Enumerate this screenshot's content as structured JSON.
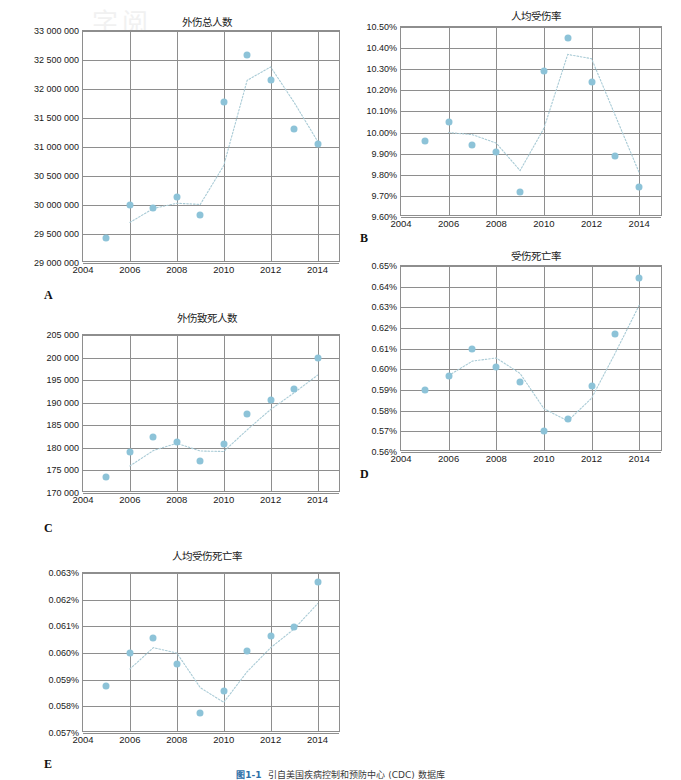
{
  "document": {
    "watermark": "字阅",
    "caption_figure_no": "图1-1",
    "caption_text": "引自美国疾病控制和预防中心 (CDC) 数据库"
  },
  "panels": [
    {
      "letter": "A",
      "title": "外伤总人数",
      "x": 62,
      "y": 14,
      "w": 290,
      "h": 260,
      "plot": {
        "left": 82,
        "top": 30,
        "width": 258,
        "height": 232
      },
      "letter_pos": {
        "left": 44,
        "top": 288
      }
    },
    {
      "letter": "B",
      "title": "人均受伤率",
      "x": 398,
      "y": 8,
      "w": 275,
      "h": 230,
      "plot": {
        "left": 400,
        "top": 26,
        "width": 262,
        "height": 190
      },
      "letter_pos": {
        "left": 360,
        "top": 231
      }
    },
    {
      "letter": "C",
      "title": "外伤致死人数",
      "x": 62,
      "y": 310,
      "w": 290,
      "h": 230,
      "plot": {
        "left": 82,
        "top": 334,
        "width": 258,
        "height": 158
      },
      "letter_pos": {
        "left": 44,
        "top": 521
      }
    },
    {
      "letter": "D",
      "title": "受伤死亡率",
      "x": 398,
      "y": 248,
      "w": 275,
      "h": 230,
      "plot": {
        "left": 400,
        "top": 265,
        "width": 262,
        "height": 186
      },
      "letter_pos": {
        "left": 360,
        "top": 467
      }
    },
    {
      "letter": "E",
      "title": "人均受伤死亡率",
      "x": 62,
      "y": 548,
      "w": 290,
      "h": 230,
      "plot": {
        "left": 82,
        "top": 572,
        "width": 258,
        "height": 160
      },
      "letter_pos": {
        "left": 44,
        "top": 757
      }
    }
  ],
  "chart_data": [
    {
      "panel": "A",
      "type": "scatter",
      "title": "外伤总人数",
      "xlabel": "",
      "ylabel": "",
      "xlim": [
        2004,
        2015
      ],
      "ylim": [
        29000000,
        33000000
      ],
      "xticks": [
        2004,
        2006,
        2008,
        2010,
        2012,
        2014
      ],
      "xticklabels": [
        "2004",
        "2006",
        "2008",
        "2010",
        "2012",
        "2014"
      ],
      "yticks": [
        29000000,
        29500000,
        30000000,
        30500000,
        31000000,
        31500000,
        32000000,
        32500000,
        33000000
      ],
      "yticklabels": [
        "29 000 000",
        "29 500 000",
        "30 000 000",
        "30 500 000",
        "31 000 000",
        "31 500 000",
        "32 000 000",
        "32 500 000",
        "33 000 000"
      ],
      "grid": true,
      "legend": "none",
      "x": [
        2005,
        2006,
        2007,
        2008,
        2009,
        2010,
        2011,
        2012,
        2013,
        2014
      ],
      "values": [
        29430000,
        29995000,
        29940000,
        30135000,
        29820000,
        31770000,
        32580000,
        32160000,
        31310000,
        31050000
      ],
      "trendline": [
        29700000,
        29940000,
        30030000,
        30010000,
        30680000,
        32150000,
        32380000,
        31770000,
        31100000
      ],
      "trend_x": [
        2006,
        2007,
        2008,
        2009,
        2010,
        2011,
        2012,
        2013,
        2014
      ],
      "series_color": "#8dc3d8"
    },
    {
      "panel": "B",
      "type": "scatter",
      "title": "人均受伤率",
      "xlabel": "",
      "ylabel": "",
      "xlim": [
        2004,
        2015
      ],
      "ylim": [
        9.6,
        10.5
      ],
      "xticks": [
        2004,
        2006,
        2008,
        2010,
        2012,
        2014
      ],
      "xticklabels": [
        "2004",
        "2006",
        "2008",
        "2010",
        "2012",
        "2014"
      ],
      "yticks": [
        9.6,
        9.7,
        9.8,
        9.9,
        10.0,
        10.1,
        10.2,
        10.3,
        10.4,
        10.5
      ],
      "yticklabels": [
        "9.60%",
        "9.70%",
        "9.80%",
        "9.90%",
        "10.00%",
        "10.10%",
        "10.20%",
        "10.30%",
        "10.40%",
        "10.50%"
      ],
      "grid": true,
      "legend": "none",
      "x": [
        2005,
        2006,
        2007,
        2008,
        2009,
        2010,
        2011,
        2012,
        2013,
        2014
      ],
      "values": [
        9.96,
        10.05,
        9.94,
        9.91,
        9.72,
        10.29,
        10.45,
        10.24,
        9.89,
        9.74
      ],
      "trend_x": [
        2006,
        2007,
        2008,
        2009,
        2010,
        2011,
        2012,
        2013,
        2014
      ],
      "trendline": [
        10.0,
        9.99,
        9.95,
        9.82,
        10.02,
        10.37,
        10.35,
        10.08,
        9.81
      ],
      "series_color": "#8dc3d8"
    },
    {
      "panel": "C",
      "type": "scatter",
      "title": "外伤致死人数",
      "xlabel": "",
      "ylabel": "",
      "xlim": [
        2004,
        2015
      ],
      "ylim": [
        170000,
        205000
      ],
      "xticks": [
        2004,
        2006,
        2008,
        2010,
        2012,
        2014
      ],
      "xticklabels": [
        "2004",
        "2006",
        "2008",
        "2010",
        "2012",
        "2014"
      ],
      "yticks": [
        170000,
        175000,
        180000,
        185000,
        190000,
        195000,
        200000,
        205000
      ],
      "yticklabels": [
        "170 000",
        "175 000",
        "180 000",
        "185 000",
        "190 000",
        "195 000",
        "200 000",
        "205 000"
      ],
      "grid": true,
      "legend": "none",
      "x": [
        2005,
        2006,
        2007,
        2008,
        2009,
        2010,
        2011,
        2012,
        2013,
        2014
      ],
      "values": [
        173600,
        179000,
        182400,
        181300,
        177100,
        180800,
        187600,
        190500,
        193000,
        199800
      ],
      "trend_x": [
        2006,
        2007,
        2008,
        2009,
        2010,
        2011,
        2012,
        2013,
        2014
      ],
      "trendline": [
        176000,
        179400,
        181000,
        179300,
        179200,
        184000,
        188500,
        192200,
        196100
      ],
      "series_color": "#8dc3d8"
    },
    {
      "panel": "D",
      "type": "scatter",
      "title": "受伤死亡率",
      "xlabel": "",
      "ylabel": "",
      "xlim": [
        2004,
        2015
      ],
      "ylim": [
        0.56,
        0.65
      ],
      "xticks": [
        2004,
        2006,
        2008,
        2010,
        2012,
        2014
      ],
      "xticklabels": [
        "2004",
        "2006",
        "2008",
        "2010",
        "2012",
        "2014"
      ],
      "yticks": [
        0.56,
        0.57,
        0.58,
        0.59,
        0.6,
        0.61,
        0.62,
        0.63,
        0.64,
        0.65
      ],
      "yticklabels": [
        "0.56%",
        "0.57%",
        "0.58%",
        "0.59%",
        "0.60%",
        "0.61%",
        "0.62%",
        "0.63%",
        "0.64%",
        "0.65%"
      ],
      "grid": true,
      "legend": "none",
      "x": [
        2005,
        2006,
        2007,
        2008,
        2009,
        2010,
        2011,
        2012,
        2013,
        2014
      ],
      "values": [
        0.59,
        0.597,
        0.61,
        0.601,
        0.594,
        0.57,
        0.576,
        0.592,
        0.617,
        0.644
      ],
      "trend_x": [
        2006,
        2007,
        2008,
        2009,
        2010,
        2011,
        2012,
        2013,
        2014
      ],
      "trendline": [
        0.597,
        0.604,
        0.6055,
        0.598,
        0.581,
        0.575,
        0.586,
        0.608,
        0.631
      ],
      "series_color": "#8dc3d8"
    },
    {
      "panel": "E",
      "type": "scatter",
      "title": "人均受伤死亡率",
      "xlabel": "",
      "ylabel": "",
      "xlim": [
        2004,
        2015
      ],
      "ylim": [
        0.057,
        0.063
      ],
      "xticks": [
        2004,
        2006,
        2008,
        2010,
        2012,
        2014
      ],
      "xticklabels": [
        "2004",
        "2006",
        "2008",
        "2010",
        "2012",
        "2014"
      ],
      "yticks": [
        0.057,
        0.058,
        0.059,
        0.06,
        0.061,
        0.062,
        0.063
      ],
      "yticklabels": [
        "0.057%",
        "0.058%",
        "0.059%",
        "0.060%",
        "0.061%",
        "0.062%",
        "0.063%"
      ],
      "grid": true,
      "legend": "none",
      "x": [
        2005,
        2006,
        2007,
        2008,
        2009,
        2010,
        2011,
        2012,
        2013,
        2014
      ],
      "values": [
        0.05876,
        0.05999,
        0.06055,
        0.05958,
        0.05776,
        0.05858,
        0.06006,
        0.06063,
        0.06099,
        0.06266
      ],
      "trend_x": [
        2006,
        2007,
        2008,
        2009,
        2010,
        2011,
        2012,
        2013,
        2014
      ],
      "trendline": [
        0.0594,
        0.0602,
        0.06,
        0.0587,
        0.05815,
        0.0593,
        0.0602,
        0.0609,
        0.06185
      ],
      "series_color": "#8dc3d8"
    }
  ]
}
